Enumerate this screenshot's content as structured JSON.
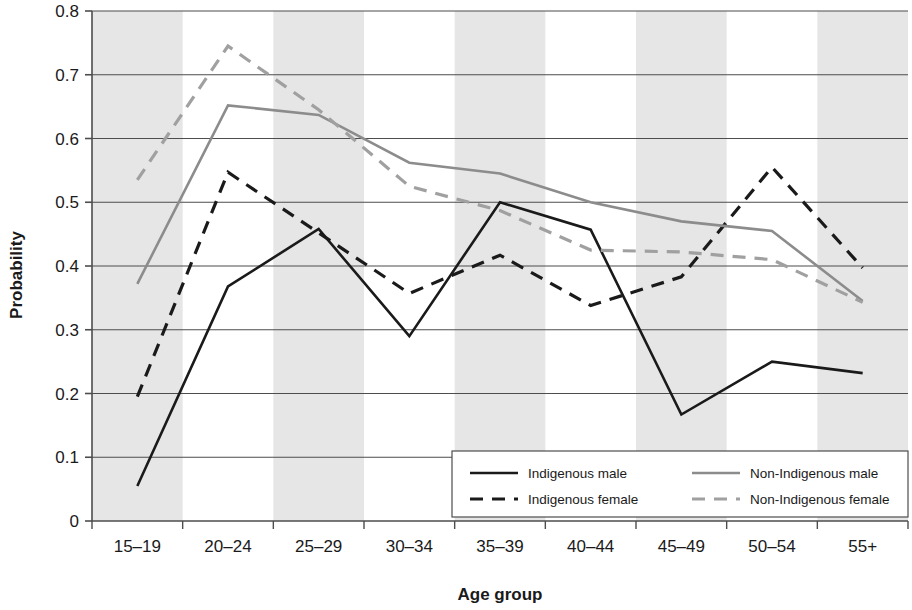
{
  "chart_data": {
    "type": "line",
    "title": "",
    "xlabel": "Age group",
    "ylabel": "Probability",
    "categories": [
      "15–19",
      "20–24",
      "25–29",
      "30–34",
      "35–39",
      "40–44",
      "45–49",
      "50–54",
      "55+"
    ],
    "ylim": [
      0,
      0.8
    ],
    "ytick_labels": [
      "0",
      "0.1",
      "0.2",
      "0.3",
      "0.4",
      "0.5",
      "0.6",
      "0.7",
      "0.8"
    ],
    "ytick_values": [
      0,
      0.1,
      0.2,
      0.3,
      0.4,
      0.5,
      0.6,
      0.7,
      0.8
    ],
    "grid": "horizontal",
    "legend_position": "inside-bottom-right",
    "banding": "alternating-vertical-gray",
    "series": [
      {
        "name": "Indigenous male",
        "color": "#1a1a1a",
        "style": "solid",
        "values": [
          0.055,
          0.368,
          0.458,
          0.29,
          0.5,
          0.457,
          0.167,
          0.25,
          0.232
        ]
      },
      {
        "name": "Indigenous female",
        "color": "#1a1a1a",
        "style": "dashed",
        "values": [
          0.195,
          0.547,
          0.452,
          0.357,
          0.417,
          0.338,
          0.383,
          0.555,
          0.397
        ]
      },
      {
        "name": "Non-Indigenous male",
        "color": "#8c8c8c",
        "style": "solid",
        "values": [
          0.372,
          0.652,
          0.637,
          0.562,
          0.545,
          0.5,
          0.47,
          0.455,
          0.345
        ]
      },
      {
        "name": "Non-Indigenous female",
        "color": "#a0a0a0",
        "style": "dashed",
        "values": [
          0.535,
          0.745,
          0.645,
          0.525,
          0.487,
          0.425,
          0.422,
          0.41,
          0.343
        ]
      }
    ]
  },
  "legend": {
    "entries": [
      {
        "label": "Indigenous male"
      },
      {
        "label": "Indigenous female"
      },
      {
        "label": "Non-Indigenous male"
      },
      {
        "label": "Non-Indigenous female"
      }
    ]
  },
  "colors": {
    "indigenous": "#1a1a1a",
    "non_indigenous": "#8c8c8c",
    "band": "#e6e6e6",
    "gridline": "#4d4d4d",
    "axis": "#4d4d4d"
  }
}
